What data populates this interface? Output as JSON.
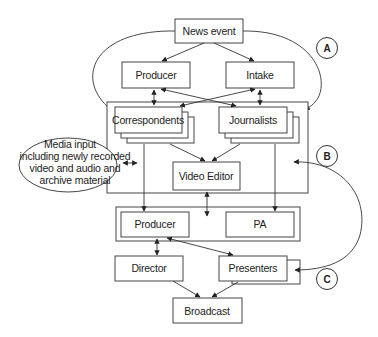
{
  "diagram": {
    "nodes": {
      "news_event": "News event",
      "producer_top": "Producer",
      "intake": "Intake",
      "correspondents": "Correspondents",
      "journalists": "Journalists",
      "media_input_line1": "Media input",
      "media_input_line2": "including newly recorded",
      "media_input_line3": "video and audio and",
      "media_input_line4": "archive material",
      "video_editor": "Video Editor",
      "producer_bottom": "Producer",
      "pa": "PA",
      "director": "Director",
      "presenters": "Presenters",
      "broadcast": "Broadcast"
    },
    "markers": {
      "a": "A",
      "b": "B",
      "c": "C"
    },
    "edges": [
      {
        "from": "News event",
        "to": "Producer",
        "type": "arrow"
      },
      {
        "from": "News event",
        "to": "Intake",
        "type": "arrow"
      },
      {
        "from": "Producer",
        "to": "Correspondents",
        "type": "bidirectional"
      },
      {
        "from": "Producer",
        "to": "Journalists",
        "type": "bidirectional"
      },
      {
        "from": "Intake",
        "to": "Correspondents",
        "type": "bidirectional"
      },
      {
        "from": "Intake",
        "to": "Journalists",
        "type": "bidirectional"
      },
      {
        "from": "News event",
        "to": "Correspondents",
        "type": "curved-arrow"
      },
      {
        "from": "News event",
        "to": "Journalists",
        "type": "curved-arrow"
      },
      {
        "from": "Media input",
        "to": "Group B",
        "type": "bidirectional"
      },
      {
        "from": "Correspondents",
        "to": "Video Editor",
        "type": "arrow"
      },
      {
        "from": "Journalists",
        "to": "Video Editor",
        "type": "arrow"
      },
      {
        "from": "Correspondents",
        "to": "Producer (bottom)",
        "type": "arrow"
      },
      {
        "from": "Journalists",
        "to": "PA",
        "type": "arrow"
      },
      {
        "from": "Video Editor",
        "to": "Producer/PA group",
        "type": "bidirectional"
      },
      {
        "from": "Producer (bottom)",
        "to": "Director",
        "type": "bidirectional"
      },
      {
        "from": "Producer (bottom)",
        "to": "Presenters",
        "type": "bidirectional"
      },
      {
        "from": "Group B",
        "to": "Presenters",
        "type": "curved-bidirectional"
      },
      {
        "from": "Director",
        "to": "Broadcast",
        "type": "arrow"
      },
      {
        "from": "Presenters",
        "to": "Broadcast",
        "type": "arrow"
      }
    ]
  }
}
